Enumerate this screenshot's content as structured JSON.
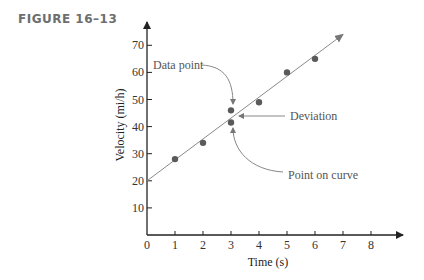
{
  "figure": {
    "label": "FIGURE 16–13"
  },
  "chart_data": {
    "type": "scatter",
    "title": "",
    "xlabel": "Time (s)",
    "ylabel": "Velocity (mi/h)",
    "xlim": [
      0,
      9
    ],
    "ylim": [
      0,
      75
    ],
    "x_ticks": [
      0,
      1,
      2,
      3,
      4,
      5,
      6,
      7,
      8
    ],
    "y_ticks": [
      10,
      20,
      30,
      40,
      50,
      60,
      70
    ],
    "grid": false,
    "series": [
      {
        "name": "Data points",
        "x": [
          1,
          2,
          3,
          4,
          5,
          6
        ],
        "y": [
          28,
          34,
          46,
          49,
          60,
          65
        ]
      },
      {
        "name": "Point on curve",
        "x": [
          3
        ],
        "y": [
          41.5
        ]
      }
    ],
    "fit_line": {
      "x": [
        0,
        7
      ],
      "y": [
        20,
        74
      ],
      "style": "line with arrow"
    },
    "annotations": [
      {
        "text": "Data point",
        "target": [
          3,
          46
        ]
      },
      {
        "text": "Deviation",
        "target": [
          3,
          44
        ]
      },
      {
        "text": "Point on curve",
        "target": [
          3,
          41.5
        ]
      }
    ],
    "colors": {
      "points": "#5a5a5a",
      "line": "#8a8a8a",
      "axis": "#222222",
      "annotation": "#555555"
    }
  }
}
